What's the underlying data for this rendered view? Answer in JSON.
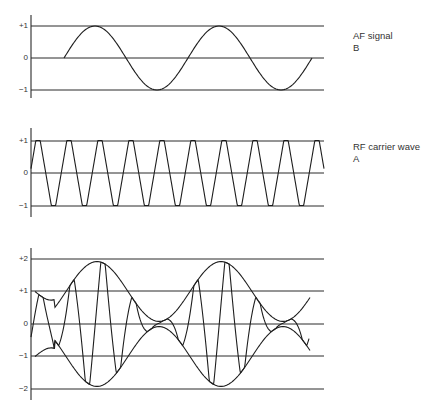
{
  "panels": [
    {
      "id": "af",
      "label_line1": "AF signal",
      "label_line2": "B",
      "ticks": [
        {
          "text": "+1",
          "y": 26
        },
        {
          "text": "0",
          "y": 58
        },
        {
          "text": "−1",
          "y": 90
        }
      ],
      "axis": {
        "x": 31,
        "y_top": 15,
        "y_bottom": 98
      },
      "line_x_end": 324
    },
    {
      "id": "rf",
      "label_line1": "RF carrier wave",
      "label_line2": "A",
      "ticks": [
        {
          "text": "+1",
          "y": 141
        },
        {
          "text": "0",
          "y": 173
        },
        {
          "text": "−1",
          "y": 206
        }
      ],
      "axis": {
        "x": 31,
        "y_top": 128,
        "y_bottom": 217
      },
      "line_x_end": 324
    },
    {
      "id": "am",
      "label_line1": "",
      "label_line2": "",
      "ticks": [
        {
          "text": "+2",
          "y": 259
        },
        {
          "text": "+1",
          "y": 291
        },
        {
          "text": "0",
          "y": 324
        },
        {
          "text": "−1",
          "y": 356
        },
        {
          "text": "−2",
          "y": 389
        }
      ],
      "axis": {
        "x": 31,
        "y_top": 248,
        "y_bottom": 400
      },
      "line_x_end": 324
    }
  ],
  "labels": {
    "af_title": "AF signal",
    "af_letter": "B",
    "rf_title": "RF carrier wave",
    "rf_letter": "A"
  },
  "chart_data": [
    {
      "type": "line",
      "title": "AF signal B",
      "ylabel": "",
      "yticks": [
        "+1",
        "0",
        "-1"
      ],
      "ylim": [
        -1,
        1
      ],
      "series": [
        {
          "name": "AF signal",
          "shape": "sine",
          "amplitude": 1,
          "cycles": 2,
          "x_start_px": 64,
          "x_end_px": 312,
          "period_px": 124
        }
      ]
    },
    {
      "type": "line",
      "title": "RF carrier wave A",
      "yticks": [
        "+1",
        "0",
        "-1"
      ],
      "ylim": [
        -1,
        1
      ],
      "series": [
        {
          "name": "RF carrier",
          "shape": "trapezoidal-sine",
          "amplitude": 1,
          "period_px": 31,
          "x_start_px": 31,
          "x_end_px": 324,
          "cycles_visible": 9.5
        }
      ]
    },
    {
      "type": "line",
      "title": "Amplitude-modulated wave",
      "yticks": [
        "+2",
        "+1",
        "0",
        "-1",
        "-2"
      ],
      "ylim": [
        -2,
        2
      ],
      "series": [
        {
          "name": "upper envelope",
          "formula": "1 + 0.9*sin(AF)",
          "min": 0.1,
          "max": 2
        },
        {
          "name": "lower envelope",
          "formula": "-(1 + 0.9*sin(AF))",
          "min": -2,
          "max": -0.1
        },
        {
          "name": "modulated carrier",
          "formula": "envelope * carrier",
          "x_start_px": 31,
          "x_end_px": 310
        }
      ]
    }
  ],
  "colors": {
    "ink": "#1e1e1e",
    "background": "#ffffff"
  }
}
